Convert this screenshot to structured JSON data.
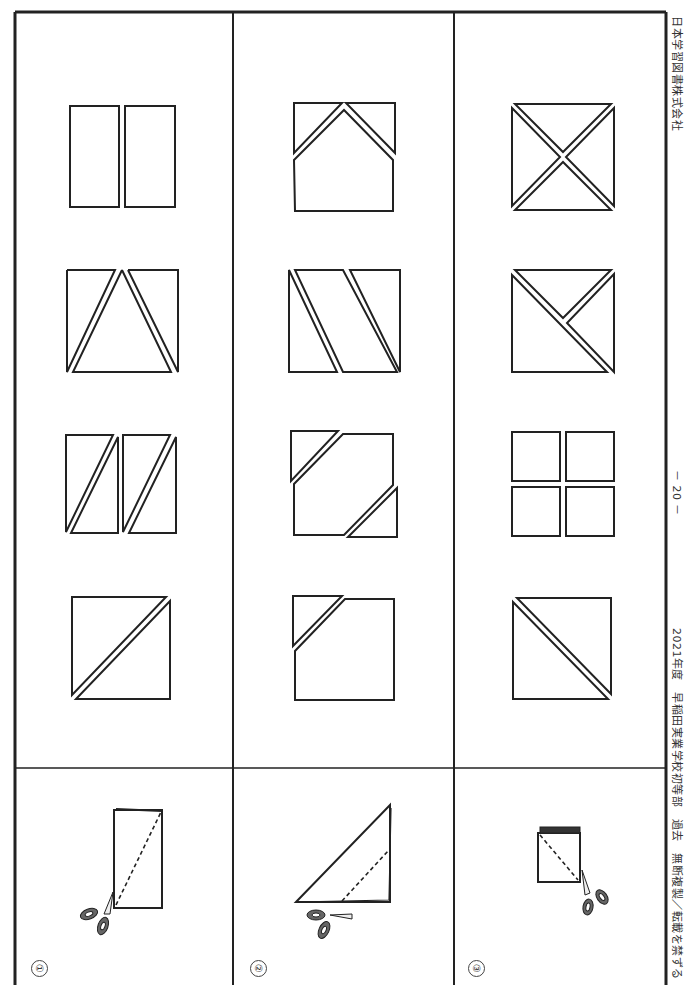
{
  "title": "問題27",
  "footer": {
    "publisher": "日本学習図書株式会社",
    "page_number": "－ 20 －",
    "source": "2021年度　早稲田実業学校初等部　過去　無断複製／転載を禁ずる"
  },
  "questions": [
    {
      "number": "①",
      "instruction_icon": "folded-rectangle-with-scissors-icon",
      "choices": [
        "two-rectangles",
        "square-split-into-triangle-center",
        "two-rectangles-each-split-diagonally",
        "square-split-diagonally"
      ]
    },
    {
      "number": "②",
      "instruction_icon": "folded-triangle-with-scissors-icon",
      "choices": [
        "house-shape-with-two-corner-triangles",
        "square-split-into-three-parallel-strips",
        "square-with-two-opposite-corners-cut",
        "square-with-one-corner-cut"
      ]
    },
    {
      "number": "③",
      "instruction_icon": "folded-square-stack-with-scissors-icon",
      "choices": [
        "square-split-into-four-triangles",
        "square-split-into-three-triangles",
        "four-small-squares",
        "square-split-diagonally"
      ]
    }
  ],
  "colors": {
    "line": "#222222",
    "background": "#ffffff",
    "scissors": "#555555"
  }
}
